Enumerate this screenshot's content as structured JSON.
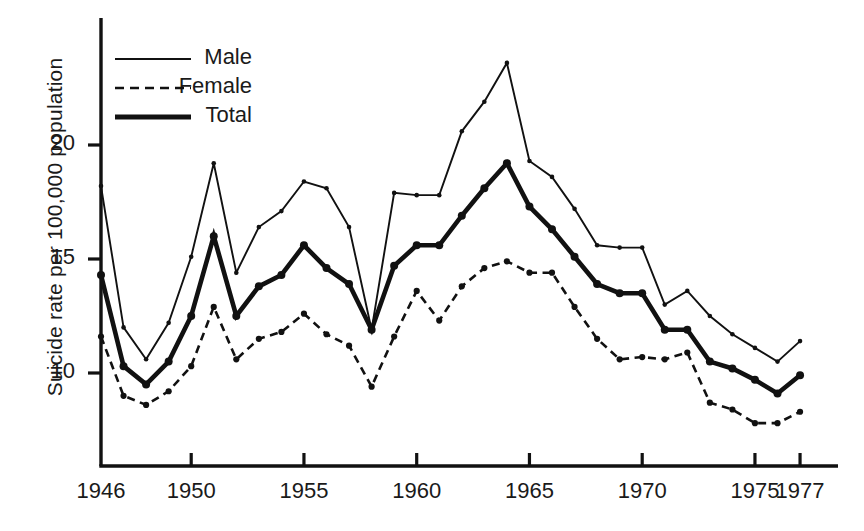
{
  "axes": {
    "ylabel": "Suicide rate per 100,000 population",
    "yticks": [
      "20",
      "15",
      "10"
    ],
    "ytick_values": [
      20,
      15,
      10
    ],
    "xticks": [
      "1946",
      "1950",
      "1955",
      "1960",
      "1965",
      "1970",
      "1975",
      "1977"
    ],
    "xtick_values": [
      1946,
      1950,
      1955,
      1960,
      1965,
      1970,
      1975,
      1977
    ]
  },
  "legend": {
    "items": [
      {
        "label": "Male",
        "style": "thin-solid"
      },
      {
        "label": "Female",
        "style": "dashed"
      },
      {
        "label": "Total",
        "style": "thick-solid"
      }
    ]
  },
  "chart_data": {
    "type": "line",
    "title": "",
    "xlabel": "",
    "ylabel": "Suicide rate per 100,000 population",
    "xlim": [
      1946,
      1977
    ],
    "ylim": [
      6.2,
      24.6
    ],
    "grid": false,
    "legend_position": "upper-left-inside",
    "x": [
      1946,
      1947,
      1948,
      1949,
      1950,
      1951,
      1952,
      1953,
      1954,
      1955,
      1956,
      1957,
      1958,
      1959,
      1960,
      1961,
      1962,
      1963,
      1964,
      1965,
      1966,
      1967,
      1968,
      1969,
      1970,
      1971,
      1972,
      1973,
      1974,
      1975,
      1976,
      1977
    ],
    "series": [
      {
        "name": "Male",
        "style": "thin-solid",
        "values": [
          18.2,
          12.0,
          10.6,
          12.2,
          15.1,
          19.2,
          14.4,
          16.4,
          17.1,
          18.4,
          18.1,
          16.4,
          11.9,
          17.9,
          17.8,
          17.8,
          20.6,
          21.9,
          23.6,
          19.3,
          18.6,
          17.2,
          15.6,
          15.5,
          15.5,
          13.0,
          13.6,
          12.5,
          11.7,
          11.1,
          10.5,
          11.4
        ]
      },
      {
        "name": "Female",
        "style": "dashed",
        "values": [
          11.6,
          9.0,
          8.6,
          9.2,
          10.3,
          12.9,
          10.6,
          11.5,
          11.8,
          12.6,
          11.7,
          11.2,
          9.4,
          11.6,
          13.6,
          12.3,
          13.8,
          14.6,
          14.9,
          14.4,
          14.4,
          12.9,
          11.5,
          10.6,
          10.7,
          10.6,
          10.9,
          8.7,
          8.4,
          7.8,
          7.8,
          8.3
        ]
      },
      {
        "name": "Total",
        "style": "thick-solid",
        "values": [
          14.3,
          10.3,
          9.5,
          10.5,
          12.5,
          16.0,
          12.5,
          13.8,
          14.3,
          15.6,
          14.6,
          13.9,
          11.9,
          14.7,
          15.6,
          15.6,
          16.9,
          18.1,
          19.2,
          17.3,
          16.3,
          15.1,
          13.9,
          13.5,
          13.5,
          11.9,
          11.9,
          10.5,
          10.2,
          9.7,
          9.1,
          9.9
        ]
      }
    ]
  }
}
